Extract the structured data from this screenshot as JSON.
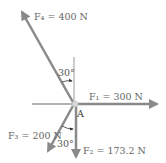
{
  "diagram": {
    "point": "A",
    "forces": {
      "f1": {
        "label": "F₁ = 300 N",
        "magnitude": "300 N",
        "direction": "right (horizontal)"
      },
      "f2": {
        "label": "F₂ = 173.2 N",
        "magnitude": "173.2 N",
        "direction": "down (vertical)"
      },
      "f3": {
        "label": "F₃ = 200 N",
        "magnitude": "200 N",
        "direction": "down-left, 30° from vertical"
      },
      "f4": {
        "label": "F₄ = 400 N",
        "magnitude": "400 N",
        "direction": "up-left, 30° from vertical"
      }
    },
    "angles": {
      "upper": "30°",
      "lower": "30°"
    },
    "colors": {
      "arrow": "#8a8a8a",
      "reference_line": "#9a9a9a",
      "text": "#666666"
    }
  }
}
